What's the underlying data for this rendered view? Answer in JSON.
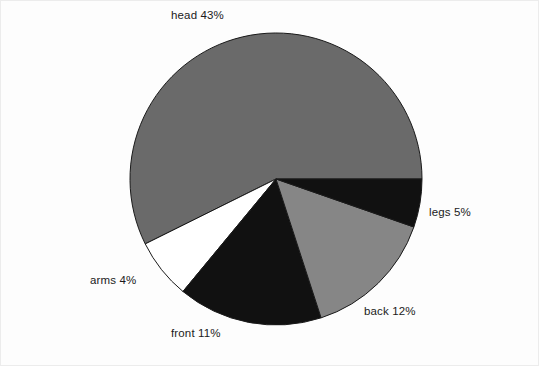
{
  "chart_data": {
    "type": "pie",
    "title": "",
    "subtitle": "",
    "xlabel": "",
    "ylabel": "",
    "legend_position": "none",
    "grid": false,
    "labels_on_slices": false,
    "label_format": "{name} {value}%",
    "start_angle_deg": 0,
    "direction": "counterclockwise",
    "categories": [
      "head",
      "legs",
      "back",
      "front",
      "arms"
    ],
    "values": [
      43,
      5,
      12,
      11,
      4
    ],
    "unit": "%",
    "total": 75,
    "slices": [
      {
        "name": "head",
        "value": 43,
        "label": "head 43%",
        "color": "#6a6a6a",
        "edge_color": "#1a1a1a"
      },
      {
        "name": "legs",
        "value": 5,
        "label": "legs 5%",
        "color": "#ffffff",
        "edge_color": "#1a1a1a"
      },
      {
        "name": "back",
        "value": 12,
        "label": "back 12%",
        "color": "#111111",
        "edge_color": "#1a1a1a"
      },
      {
        "name": "front",
        "value": 11,
        "label": "front 11%",
        "color": "#868686",
        "edge_color": "#1a1a1a"
      },
      {
        "name": "arms",
        "value": 4,
        "label": "arms 4%",
        "color": "#111111",
        "edge_color": "#1a1a1a"
      }
    ]
  },
  "figure": {
    "background_color": "#fdfdfd",
    "frame_color": "#ececec",
    "center_x": 275,
    "center_y": 178,
    "radius": 146
  },
  "labels": {
    "head": "head 43%",
    "legs": "legs 5%",
    "back": "back 12%",
    "front": "front 11%",
    "arms": "arms 4%"
  }
}
